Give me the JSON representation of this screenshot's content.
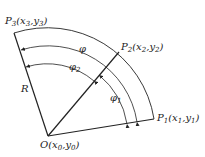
{
  "diagram": {
    "type": "circular-arc geometry",
    "stroke_color": "#222222",
    "points": {
      "O": {
        "label": "O(x",
        "sub0": "0",
        "mid": ",y",
        "sub1": "0",
        "end": ")"
      },
      "P1": {
        "label": "P",
        "idx": "1",
        "coords_open": "(x",
        "xsub": "1",
        "mid": ",y",
        "ysub": "1",
        "end": ")"
      },
      "P2": {
        "label": "P",
        "idx": "2",
        "coords_open": "(x",
        "xsub": "2",
        "mid": ",y",
        "ysub": "2",
        "end": ")"
      },
      "P3": {
        "label": "P",
        "idx": "3",
        "coords_open": "(x",
        "xsub": "3",
        "mid": ",y",
        "ysub": "3",
        "end": ")"
      }
    },
    "radius_label": "R",
    "angles": {
      "phi": {
        "symbol": "φ"
      },
      "phi2": {
        "symbol": "φ",
        "sub": "2"
      },
      "phi1": {
        "symbol": "φ",
        "sub": "1"
      }
    }
  }
}
